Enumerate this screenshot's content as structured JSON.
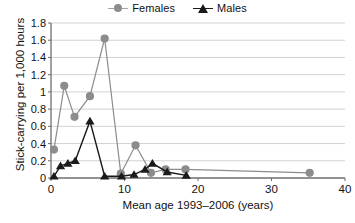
{
  "legend": {
    "position": "top-center",
    "entries": [
      {
        "label": "Females",
        "marker": "circle-marker-icon",
        "color": "#8c8c8c"
      },
      {
        "label": "Males",
        "marker": "triangle-marker-icon",
        "color": "#1a1a1a"
      }
    ]
  },
  "axes": {
    "x_title": "Mean age 1993–2006 (years)",
    "y_title": "Stick-carrying per 1,000 hours",
    "x_ticks": [
      "0",
      "10",
      "20",
      "30",
      "40"
    ],
    "y_ticks": [
      "0",
      "0.2",
      "0.4",
      "0.6",
      "0.8",
      "1",
      "1.2",
      "1.4",
      "1.6",
      "1.8"
    ]
  },
  "chart_data": {
    "type": "line",
    "title": "",
    "subtitle": "",
    "xlabel": "Mean age 1993–2006 (years)",
    "ylabel": "Stick-carrying per 1,000 hours",
    "xlim": [
      0,
      40
    ],
    "ylim": [
      0,
      1.8
    ],
    "xticks": [
      0,
      10,
      20,
      30,
      40
    ],
    "yticks": [
      0,
      0.2,
      0.4,
      0.6,
      0.8,
      1.0,
      1.2,
      1.4,
      1.6,
      1.8
    ],
    "grid": "horizontal",
    "legend": [
      "Females",
      "Males"
    ],
    "series": [
      {
        "name": "Females",
        "color": "#8c8c8c",
        "marker": "circle",
        "points": [
          [
            0.4,
            0.33
          ],
          [
            1.8,
            1.07
          ],
          [
            3.2,
            0.71
          ],
          [
            5.3,
            0.95
          ],
          [
            7.3,
            1.62
          ],
          [
            9.5,
            0.05
          ],
          [
            11.5,
            0.38
          ],
          [
            13.6,
            0.06
          ],
          [
            15.6,
            0.1
          ],
          [
            18.3,
            0.1
          ],
          [
            35.2,
            0.06
          ]
        ]
      },
      {
        "name": "Males",
        "color": "#1a1a1a",
        "marker": "triangle",
        "points": [
          [
            0.4,
            0.02
          ],
          [
            1.3,
            0.14
          ],
          [
            2.3,
            0.17
          ],
          [
            3.3,
            0.2
          ],
          [
            5.3,
            0.66
          ],
          [
            7.3,
            0.02
          ],
          [
            9.6,
            0.02
          ],
          [
            11.3,
            0.04
          ],
          [
            12.8,
            0.1
          ],
          [
            13.8,
            0.17
          ],
          [
            15.8,
            0.07
          ],
          [
            18.4,
            0.03
          ]
        ]
      }
    ]
  }
}
